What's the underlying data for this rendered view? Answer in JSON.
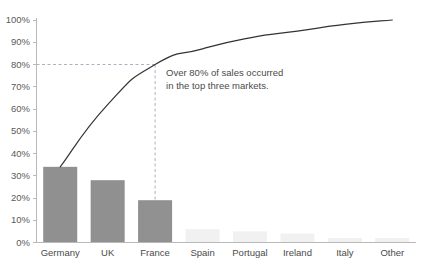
{
  "chart_data": {
    "type": "bar",
    "title": "",
    "xlabel": "",
    "ylabel": "",
    "categories": [
      "Germany",
      "UK",
      "France",
      "Spain",
      "Portugal",
      "Ireland",
      "Italy",
      "Other"
    ],
    "values": [
      34,
      28,
      19,
      6,
      5,
      4,
      2,
      2
    ],
    "series": [
      {
        "name": "Share of sales",
        "type": "bar",
        "values": [
          34,
          28,
          19,
          6,
          5,
          4,
          2,
          2
        ]
      },
      {
        "name": "Cumulative share",
        "type": "line",
        "values": [
          34,
          62,
          80,
          87,
          92,
          95,
          98,
          100
        ]
      }
    ],
    "ylim": [
      0,
      100
    ],
    "ytick_labels": [
      "0%",
      "10%",
      "20%",
      "30%",
      "40%",
      "50%",
      "60%",
      "70%",
      "80%",
      "90%",
      "100%"
    ],
    "ytick_values": [
      0,
      10,
      20,
      30,
      40,
      50,
      60,
      70,
      80,
      90,
      100
    ],
    "grid": false,
    "legend": "none",
    "reference_lines": [
      {
        "name": "eighty-percent-threshold",
        "orientation": "horizontal",
        "value": 80,
        "style": "dashed"
      },
      {
        "name": "france-marker",
        "orientation": "vertical",
        "category": "France",
        "style": "dashed"
      }
    ],
    "annotations": [
      {
        "name": "pareto-callout",
        "line1": "Over 80% of sales occurred",
        "line2": "in the top three markets."
      }
    ],
    "colors": {
      "bar_major": "#8f8f8f",
      "bar_minor": "#f1f1f1",
      "cumulative_line": "#333333",
      "reference_dash": "#a9b4be",
      "axis": "#b9b9b9",
      "tick_text": "#5a5a5a"
    }
  }
}
